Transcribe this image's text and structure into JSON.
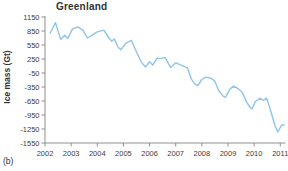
{
  "caption": "(b)",
  "chart": {
    "title": "Greenland",
    "ylabel": "Ice mass (Gt)",
    "colors": {
      "line": "#90c4e9",
      "axis": "#8f8f8f",
      "tick_text": "#3d3d3d"
    },
    "x_ticks": [
      "2002",
      "2003",
      "2004",
      "2005",
      "2006",
      "2007",
      "2008",
      "2009",
      "2010",
      "2011"
    ],
    "x_tick_years": [
      2002,
      2003,
      2004,
      2005,
      2006,
      2007,
      2008,
      2009,
      2010,
      2011
    ],
    "y_ticks": [
      1150,
      850,
      550,
      250,
      -50,
      -350,
      -650,
      -950,
      -1250,
      -1550
    ]
  },
  "chart_data": {
    "type": "line",
    "title": "Greenland",
    "xlabel": "",
    "ylabel": "Ice mass (Gt)",
    "xlim": [
      2002,
      2011.2
    ],
    "ylim": [
      -1550,
      1150
    ],
    "grid": false,
    "legend": false,
    "series": [
      {
        "name": "Greenland ice mass anomaly (Gt)",
        "x": [
          2002.2,
          2002.4,
          2002.6,
          2002.75,
          2002.87,
          2003.05,
          2003.25,
          2003.45,
          2003.62,
          2003.8,
          2004.0,
          2004.25,
          2004.45,
          2004.55,
          2004.65,
          2004.8,
          2004.9,
          2005.1,
          2005.3,
          2005.5,
          2005.7,
          2005.85,
          2006.0,
          2006.12,
          2006.28,
          2006.45,
          2006.6,
          2006.8,
          2007.0,
          2007.2,
          2007.45,
          2007.6,
          2007.72,
          2007.85,
          2008.0,
          2008.15,
          2008.35,
          2008.5,
          2008.65,
          2008.8,
          2008.9,
          2009.08,
          2009.22,
          2009.4,
          2009.55,
          2009.72,
          2009.85,
          2009.92,
          2010.05,
          2010.22,
          2010.35,
          2010.48,
          2010.65,
          2010.8,
          2010.9,
          2011.05,
          2011.15
        ],
        "y": [
          800,
          1030,
          670,
          760,
          690,
          890,
          940,
          870,
          700,
          760,
          830,
          870,
          700,
          630,
          680,
          500,
          450,
          590,
          650,
          400,
          170,
          80,
          190,
          120,
          260,
          270,
          280,
          70,
          170,
          120,
          60,
          -180,
          -280,
          -320,
          -190,
          -140,
          -160,
          -230,
          -430,
          -540,
          -570,
          -390,
          -330,
          -390,
          -470,
          -680,
          -790,
          -820,
          -660,
          -590,
          -640,
          -590,
          -890,
          -1180,
          -1310,
          -1170,
          -1160
        ]
      }
    ]
  }
}
